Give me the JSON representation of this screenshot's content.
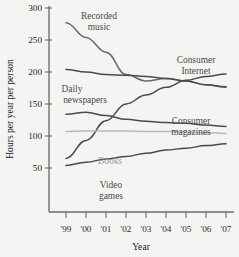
{
  "chart_data": {
    "type": "line",
    "title": "",
    "xlabel": "Year",
    "ylabel": "Hours per year per person",
    "x": [
      "'99",
      "'00",
      "'01",
      "'02",
      "'03",
      "'04",
      "'05",
      "'06",
      "'07"
    ],
    "xlim": [
      1999,
      2007
    ],
    "ylim": [
      30,
      300
    ],
    "yticks": [
      50,
      100,
      150,
      200,
      250,
      300
    ],
    "xticks": [
      "'99",
      "'00",
      "'01",
      "'02",
      "'03",
      "'04",
      "'05",
      "'06",
      "'07"
    ],
    "grid": false,
    "legend": "inline-annotations",
    "series": [
      {
        "name": "Recorded music",
        "color": "#6b6b6b",
        "label_x": "'01",
        "values": [
          277,
          254,
          231,
          196,
          186,
          190,
          186,
          180,
          176
        ]
      },
      {
        "name": "Daily newspapers",
        "color": "#4a4a4a",
        "label_x": "'00",
        "values": [
          204,
          200,
          196,
          195,
          193,
          190,
          186,
          180,
          177
        ]
      },
      {
        "name": "Consumer Internet",
        "color": "#4a4a4a",
        "label_x": "'06",
        "values": [
          65,
          93,
          124,
          150,
          164,
          176,
          187,
          193,
          197
        ]
      },
      {
        "name": "Consumer magazines",
        "color": "#4a4a4a",
        "label_x": "'05",
        "values": [
          134,
          137,
          132,
          126,
          123,
          121,
          120,
          117,
          115
        ]
      },
      {
        "name": "Books",
        "color": "#b8b8b8",
        "label_x": "'02",
        "values": [
          107,
          108,
          108,
          108,
          107,
          107,
          106,
          105,
          104
        ]
      },
      {
        "name": "Video games",
        "color": "#4a4a4a",
        "label_x": "'02",
        "values": [
          54,
          59,
          64,
          68,
          73,
          78,
          81,
          85,
          88
        ]
      }
    ]
  },
  "annotations": {
    "recorded_music": [
      "Recorded",
      "music"
    ],
    "daily_newspapers": [
      "Daily",
      "newspapers"
    ],
    "consumer_internet": [
      "Consumer",
      "Internet"
    ],
    "consumer_magazines": [
      "Consumer",
      "magazines"
    ],
    "books": [
      "Books"
    ],
    "video_games": [
      "Video",
      "games"
    ]
  }
}
